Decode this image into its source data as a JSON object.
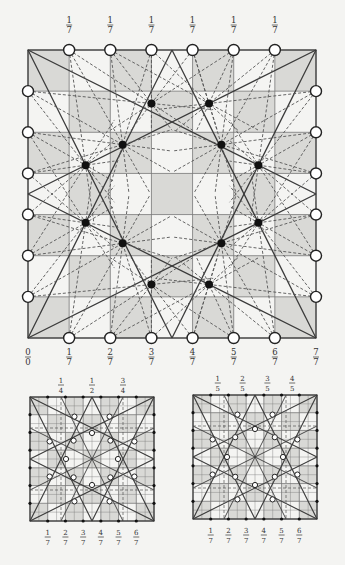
{
  "colors": {
    "background": "#f4f4f2",
    "shade": "#d9d9d6",
    "grid_line": "#777777",
    "solid_line": "#3a3a3a",
    "dashed_line": "#555555",
    "dot_fill": "#111111",
    "circle_fill": "#ffffff",
    "circle_stroke": "#222222"
  },
  "main_diagram": {
    "x": 28,
    "y": 50,
    "size": 288,
    "divisions": 7,
    "shading": "checkerboard-even",
    "top_labels": [
      {
        "num": "1",
        "den": "7"
      },
      {
        "num": "1",
        "den": "7"
      },
      {
        "num": "1",
        "den": "7"
      },
      {
        "num": "1",
        "den": "7"
      },
      {
        "num": "1",
        "den": "7"
      },
      {
        "num": "1",
        "den": "7"
      }
    ],
    "bottom_labels": [
      {
        "num": "0",
        "den": "0"
      },
      {
        "num": "1",
        "den": "7"
      },
      {
        "num": "2",
        "den": "7"
      },
      {
        "num": "3",
        "den": "7"
      },
      {
        "num": "4",
        "den": "7"
      },
      {
        "num": "5",
        "den": "7"
      },
      {
        "num": "6",
        "den": "7"
      },
      {
        "num": "7",
        "den": "7"
      }
    ],
    "black_dots": [
      [
        3.0,
        1.3
      ],
      [
        4.4,
        1.3
      ],
      [
        2.3,
        2.3
      ],
      [
        4.7,
        2.3
      ],
      [
        1.4,
        2.8
      ],
      [
        5.6,
        2.8
      ],
      [
        1.4,
        4.2
      ],
      [
        5.6,
        4.2
      ],
      [
        2.3,
        4.7
      ],
      [
        4.7,
        4.7
      ],
      [
        3.0,
        5.7
      ],
      [
        4.4,
        5.7
      ]
    ]
  },
  "small_left": {
    "x": 30,
    "y": 397,
    "size": 124,
    "divisions": 7,
    "top_labels": [
      {
        "num": "1",
        "den": "4",
        "pos": 1.75
      },
      {
        "num": "1",
        "den": "2",
        "pos": 3.5
      },
      {
        "num": "3",
        "den": "4",
        "pos": 5.25
      }
    ],
    "bottom_labels": [
      {
        "num": "1",
        "den": "7"
      },
      {
        "num": "2",
        "den": "7"
      },
      {
        "num": "3",
        "den": "7"
      },
      {
        "num": "4",
        "den": "7"
      },
      {
        "num": "5",
        "den": "7"
      },
      {
        "num": "6",
        "den": "7"
      }
    ]
  },
  "small_right": {
    "x": 193,
    "y": 395,
    "size": 124,
    "divisions": 7,
    "top_labels": [
      {
        "num": "1",
        "den": "5",
        "pos": 1.4
      },
      {
        "num": "2",
        "den": "5",
        "pos": 2.8
      },
      {
        "num": "3",
        "den": "5",
        "pos": 4.2
      },
      {
        "num": "4",
        "den": "5",
        "pos": 5.6
      }
    ],
    "bottom_labels": [
      {
        "num": "1",
        "den": "7"
      },
      {
        "num": "2",
        "den": "7"
      },
      {
        "num": "3",
        "den": "7"
      },
      {
        "num": "4",
        "den": "7"
      },
      {
        "num": "5",
        "den": "7"
      },
      {
        "num": "6",
        "den": "7"
      }
    ]
  }
}
